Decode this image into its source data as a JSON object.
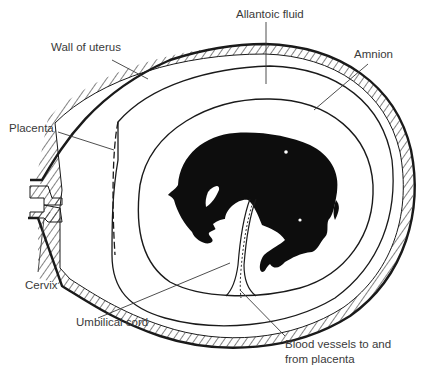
{
  "diagram": {
    "labels": {
      "allantoic_fluid": "Allantoic fluid",
      "wall_of_uterus": "Wall of uterus",
      "amnion": "Amnion",
      "placenta": "Placenta",
      "cervix": "Cervix",
      "umbilical_cord": "Umbilical cord",
      "blood_vessels_line1": "Blood vessels to and",
      "blood_vessels_line2": "from placenta"
    },
    "colors": {
      "ink": "#1a1a1a",
      "label_text": "#3a3a3a",
      "fetus_fill": "#0d0d0d",
      "background": "#ffffff"
    }
  }
}
